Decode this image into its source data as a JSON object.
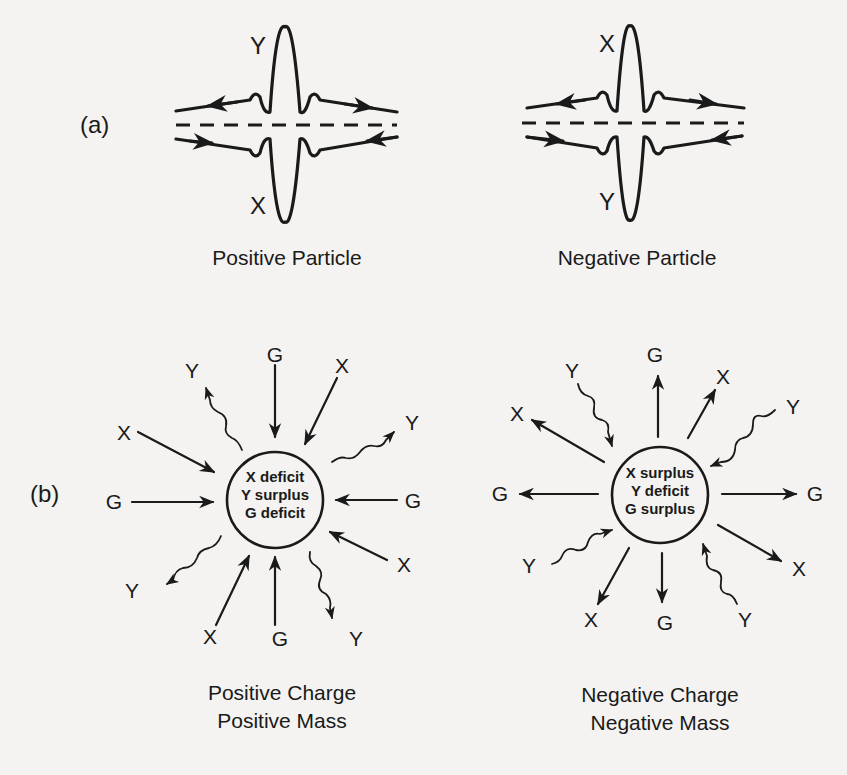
{
  "panel_a": {
    "label": "(a)",
    "positive": {
      "caption": "Positive Particle",
      "top_label": "Y",
      "bottom_label": "X"
    },
    "negative": {
      "caption": "Negative Particle",
      "top_label": "X",
      "bottom_label": "Y"
    }
  },
  "panel_b": {
    "label": "(b)",
    "positive": {
      "caption_line1": "Positive Charge",
      "caption_line2": "Positive Mass",
      "center_lines": [
        "X deficit",
        "Y surplus",
        "G deficit"
      ],
      "rays": [
        {
          "label": "G",
          "kind": "straight",
          "direction": "inward"
        },
        {
          "label": "X",
          "kind": "straight",
          "direction": "inward"
        },
        {
          "label": "Y",
          "kind": "wavy",
          "direction": "outward"
        },
        {
          "label": "G",
          "kind": "straight",
          "direction": "inward"
        },
        {
          "label": "X",
          "kind": "straight",
          "direction": "inward"
        },
        {
          "label": "Y",
          "kind": "wavy",
          "direction": "outward"
        },
        {
          "label": "G",
          "kind": "straight",
          "direction": "inward"
        },
        {
          "label": "X",
          "kind": "straight",
          "direction": "inward"
        },
        {
          "label": "Y",
          "kind": "wavy",
          "direction": "outward"
        },
        {
          "label": "G",
          "kind": "straight",
          "direction": "inward"
        },
        {
          "label": "X",
          "kind": "straight",
          "direction": "inward"
        },
        {
          "label": "Y",
          "kind": "wavy",
          "direction": "outward"
        }
      ]
    },
    "negative": {
      "caption_line1": "Negative Charge",
      "caption_line2": "Negative Mass",
      "center_lines": [
        "X surplus",
        "Y deficit",
        "G surplus"
      ],
      "rays": [
        {
          "label": "G",
          "kind": "straight",
          "direction": "outward"
        },
        {
          "label": "X",
          "kind": "straight",
          "direction": "outward"
        },
        {
          "label": "Y",
          "kind": "wavy",
          "direction": "inward"
        },
        {
          "label": "G",
          "kind": "straight",
          "direction": "outward"
        },
        {
          "label": "X",
          "kind": "straight",
          "direction": "outward"
        },
        {
          "label": "Y",
          "kind": "wavy",
          "direction": "inward"
        },
        {
          "label": "G",
          "kind": "straight",
          "direction": "outward"
        },
        {
          "label": "X",
          "kind": "straight",
          "direction": "outward"
        },
        {
          "label": "Y",
          "kind": "wavy",
          "direction": "inward"
        },
        {
          "label": "G",
          "kind": "straight",
          "direction": "outward"
        },
        {
          "label": "X",
          "kind": "straight",
          "direction": "outward"
        },
        {
          "label": "Y",
          "kind": "wavy",
          "direction": "inward"
        }
      ]
    }
  },
  "colors": {
    "ink": "#1a1a1a",
    "paper": "#f4f3f1"
  }
}
